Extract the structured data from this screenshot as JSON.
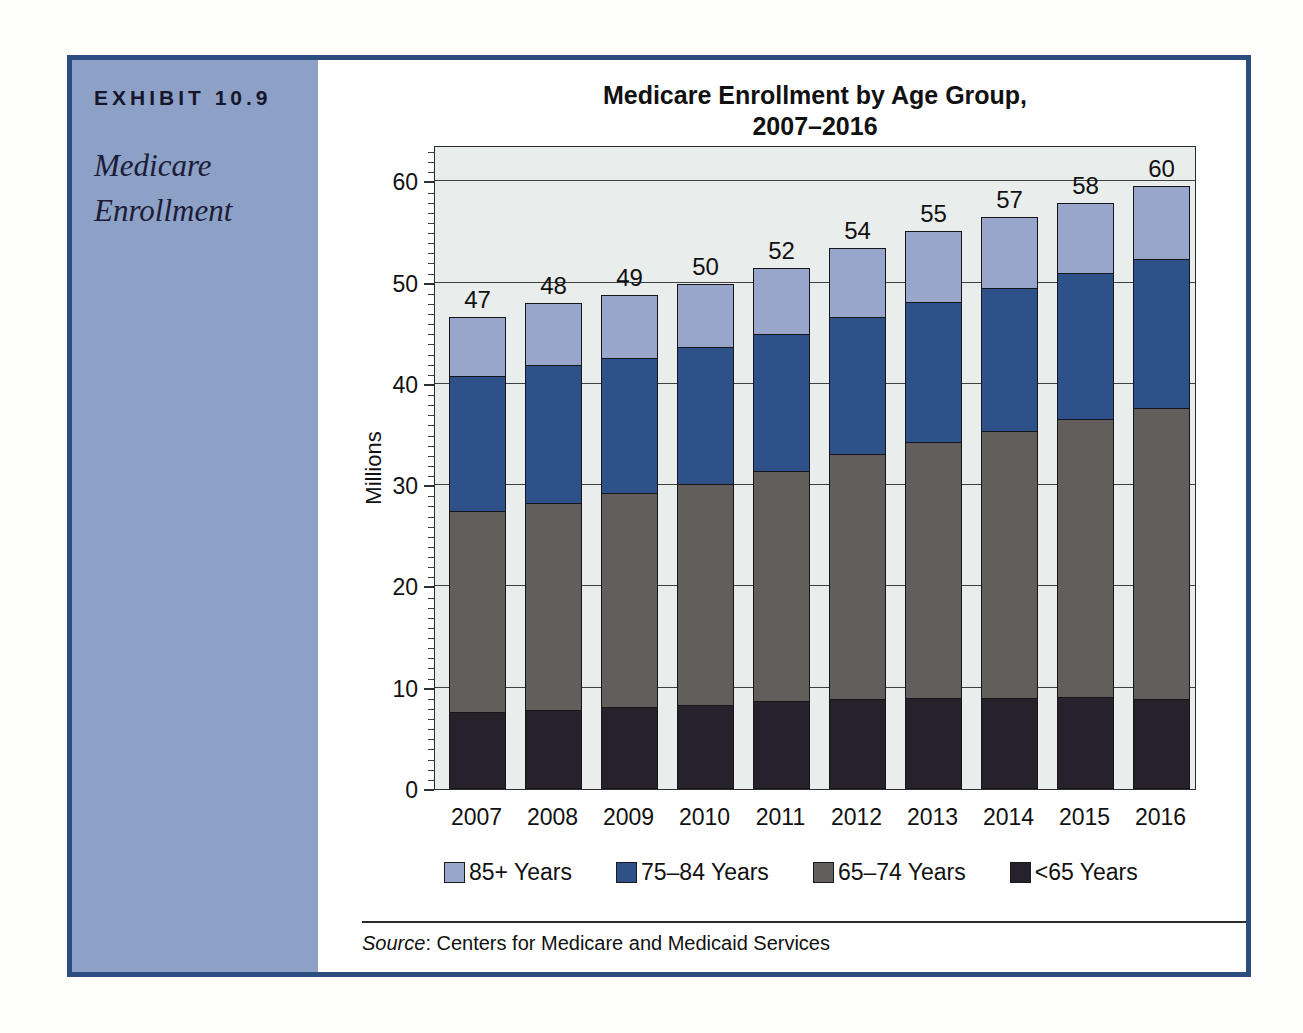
{
  "exhibit": {
    "label": "EXHIBIT 10.9",
    "title_line1": "Medicare",
    "title_line2": "Enrollment"
  },
  "chart_data": {
    "type": "bar",
    "stacked": true,
    "title_line1": "Medicare Enrollment by Age Group,",
    "title_line2": "2007–2016",
    "ylabel": "Millions",
    "xlabel": "",
    "categories": [
      "2007",
      "2008",
      "2009",
      "2010",
      "2011",
      "2012",
      "2013",
      "2014",
      "2015",
      "2016"
    ],
    "totals_labels": [
      "47",
      "48",
      "49",
      "50",
      "52",
      "54",
      "55",
      "57",
      "58",
      "60"
    ],
    "series": [
      {
        "name": "<65 Years",
        "color": "#26212a",
        "values": [
          7.5,
          7.7,
          8.0,
          8.2,
          8.6,
          8.8,
          8.9,
          8.9,
          9.0,
          8.8
        ]
      },
      {
        "name": "65–74 Years",
        "color": "#615e5c",
        "values": [
          20.0,
          20.6,
          21.3,
          21.9,
          22.8,
          24.3,
          25.4,
          26.5,
          27.6,
          28.9
        ]
      },
      {
        "name": "75–84 Years",
        "color": "#2e5189",
        "values": [
          13.4,
          13.6,
          13.3,
          13.6,
          13.6,
          13.6,
          13.9,
          14.2,
          14.4,
          14.7
        ]
      },
      {
        "name": "85+ Years",
        "color": "#98a6cc",
        "values": [
          5.7,
          6.1,
          6.2,
          6.2,
          6.5,
          6.7,
          6.9,
          6.9,
          6.9,
          7.2
        ]
      }
    ],
    "legend": [
      {
        "label": "85+ Years",
        "color": "#98a6cc"
      },
      {
        "label": "75–84 Years",
        "color": "#2e5189"
      },
      {
        "label": "65–74 Years",
        "color": "#615e5c"
      },
      {
        "label": "<65 Years",
        "color": "#26212a"
      }
    ],
    "y_axis": {
      "min": 0,
      "max": 60,
      "major_tick_step": 10,
      "minor_tick_step": 1,
      "ticks": [
        0,
        10,
        20,
        30,
        40,
        50,
        60
      ]
    },
    "grid": true,
    "legend_position": "bottom",
    "plot_background": "#e9edec"
  },
  "source": {
    "prefix": "Source",
    "text": ": Centers for Medicare and Medicaid Services"
  },
  "colors": {
    "frame_border": "#2c4d80",
    "sidebar_background": "#8da0c6"
  }
}
